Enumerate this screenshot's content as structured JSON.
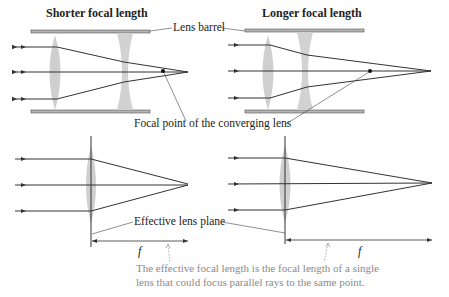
{
  "titles": {
    "left": "Shorter focal length",
    "right": "Longer focal length"
  },
  "labels": {
    "lens_barrel": "Lens barrel",
    "focal_point": "Focal point of the converging lens",
    "effective_lens_plane": "Effective lens plane",
    "f_left": "f",
    "f_right": "f"
  },
  "note": {
    "line1": "The effective focal length is the focal length of a single",
    "line2": "lens that could focus parallel rays to the same point."
  },
  "colors": {
    "ray": "#333333",
    "lens": "#c8c8c8",
    "barrel_fill": "#b4b4b4",
    "barrel_stroke": "#555555",
    "note": "#8a8a8a"
  }
}
